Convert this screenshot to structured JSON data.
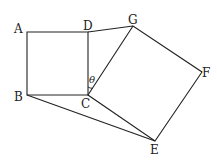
{
  "diagram": {
    "type": "geometry",
    "points": {
      "A": {
        "label": "A",
        "x": 27,
        "y": 32
      },
      "B": {
        "label": "B",
        "x": 27,
        "y": 95
      },
      "C": {
        "label": "C",
        "x": 88,
        "y": 95
      },
      "D": {
        "label": "D",
        "x": 88,
        "y": 32
      },
      "G": {
        "label": "G",
        "x": 133,
        "y": 26
      },
      "F": {
        "label": "F",
        "x": 202,
        "y": 72
      },
      "E": {
        "label": "E",
        "x": 155,
        "y": 141
      }
    },
    "angle_label": "θ",
    "segments": [
      "AB",
      "BC",
      "CD",
      "DA",
      "CG",
      "GF",
      "FE",
      "EC",
      "DG",
      "BE"
    ]
  }
}
